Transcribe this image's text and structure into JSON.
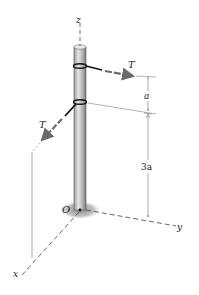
{
  "figure": {
    "labels": {
      "z_axis": "z",
      "y_axis": "y",
      "x_axis": "x",
      "origin": "O",
      "tension_upper": "T",
      "tension_lower": "T",
      "dim_upper": "a",
      "dim_lower": "3a"
    },
    "colors": {
      "pole_fill": "#b8b8b8",
      "pole_edge": "#555555",
      "rope": "#111111",
      "arrow": "#6a6a6a",
      "axis": "#444444",
      "shadow": "#9a9a9a"
    }
  }
}
